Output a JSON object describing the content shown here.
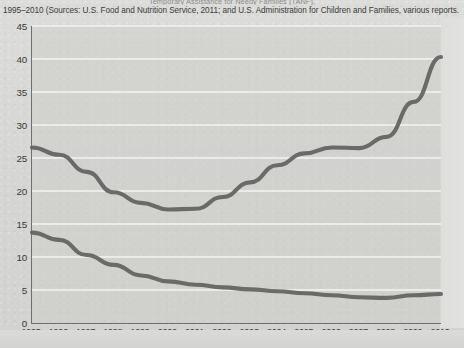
{
  "figure": {
    "title_partial": "Temporary Assistance for Needy Families (TANF),",
    "caption": "1995–2010 (Sources: U.S. Food and Nutrition Service, 2011; and U.S. Administration for Children and Families, various reports."
  },
  "chart_data": {
    "type": "line",
    "title": "Temporary Assistance for Needy Families (TANF),",
    "subtitle": "1995–2010 (Sources: U.S. Food and Nutrition Service, 2011; and U.S. Administration for Children and Families, various reports.",
    "xlabel": "",
    "ylabel": "",
    "x": [
      1995,
      1996,
      1997,
      1998,
      1999,
      2000,
      2001,
      2002,
      2003,
      2004,
      2005,
      2006,
      2007,
      2008,
      2009,
      2010
    ],
    "categories": [
      "1995",
      "1996",
      "1997",
      "1998",
      "1999",
      "2000",
      "2001",
      "2002",
      "2003",
      "2004",
      "2005",
      "2006",
      "2007",
      "2008",
      "2009",
      "2010"
    ],
    "ylim": [
      0,
      45
    ],
    "yticks": [
      0,
      5,
      10,
      15,
      20,
      25,
      30,
      35,
      40,
      45
    ],
    "xlim": [
      1995,
      2010
    ],
    "grid": true,
    "grid_axis": "y",
    "legend": false,
    "legend_position": "none",
    "series": [
      {
        "name": "Food Stamps / SNAP recipients",
        "color": "#63615f",
        "values": [
          26.6,
          25.5,
          22.9,
          19.8,
          18.2,
          17.2,
          17.3,
          19.1,
          21.3,
          23.9,
          25.7,
          26.6,
          26.5,
          28.2,
          33.5,
          40.3
        ]
      },
      {
        "name": "TANF recipients",
        "color": "#63615f",
        "values": [
          13.7,
          12.6,
          10.3,
          8.8,
          7.2,
          6.3,
          5.8,
          5.4,
          5.1,
          4.8,
          4.5,
          4.2,
          3.9,
          3.8,
          4.2,
          4.4
        ]
      }
    ]
  },
  "axis": {
    "y_tick_labels": [
      "45",
      "40",
      "35",
      "30",
      "25",
      "20",
      "15",
      "10",
      "5",
      "0"
    ],
    "x_tick_labels": [
      "1995",
      "1996",
      "1997",
      "1998",
      "1999",
      "2000",
      "2001",
      "2002",
      "2003",
      "2004",
      "2005",
      "2006",
      "2007",
      "2008",
      "2009",
      "2010"
    ]
  }
}
